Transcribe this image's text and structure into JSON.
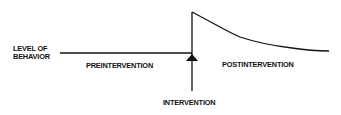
{
  "diagram": {
    "y_axis_label": {
      "line1": "LEVEL OF",
      "line2": "BEHAVIOR"
    },
    "phases": {
      "pre": "PREINTERVENTION",
      "post": "POSTINTERVENTION"
    },
    "event_marker": "INTERVENTION",
    "colors": {
      "line": "#111111",
      "background": "#ffffff"
    }
  }
}
